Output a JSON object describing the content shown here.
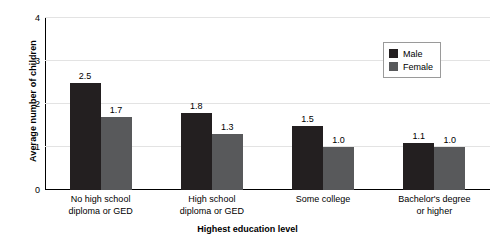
{
  "chart_data": {
    "type": "bar",
    "title": "",
    "xlabel": "Highest education level",
    "ylabel": "Average number of children",
    "categories": [
      "No high school\ndiploma or GED",
      "High school\ndiploma or GED",
      "Some college",
      "Bachelor's degree\nor higher"
    ],
    "series": [
      {
        "name": "Male",
        "color": "#231f20",
        "values": [
          2.5,
          1.8,
          1.5,
          1.1
        ],
        "labels": [
          "2.5",
          "1.8",
          "1.5",
          "1.1"
        ]
      },
      {
        "name": "Female",
        "color": "#58595b",
        "values": [
          1.7,
          1.3,
          1.0,
          1.0
        ],
        "labels": [
          "1.7",
          "1.3",
          "1.0",
          "1.0"
        ]
      }
    ],
    "ylim": [
      0,
      4
    ],
    "yticks": [
      0,
      1,
      2,
      3,
      4
    ],
    "ytick_labels": [
      "0",
      "1",
      "2",
      "3",
      "4"
    ],
    "grid": "horizontal",
    "legend_position": "upper right",
    "grid_color": "#e3e3e3",
    "axis_color": "#000000"
  },
  "legend": {
    "items": [
      {
        "label": "Male"
      },
      {
        "label": "Female"
      }
    ]
  }
}
